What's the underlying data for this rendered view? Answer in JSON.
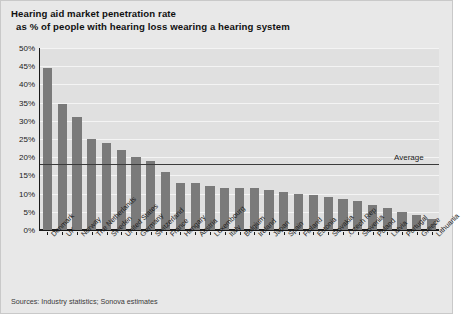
{
  "title": {
    "line1": "Hearing aid market penetration rate",
    "line2": "as % of people with hearing loss wearing a hearing system"
  },
  "footnote": "Sources: Industry statistics; Sonova estimates",
  "average": {
    "label": "Average",
    "value": 18
  },
  "colors": {
    "bar": "#7a7a7a",
    "panel_background": "#e0e0e0",
    "figure_background": "#e8e8e8",
    "gridline": "#f4f4f4",
    "axis": "#1a1a1a",
    "average_line": "#3b3b3b",
    "text": "#1a1a1a"
  },
  "chart_data": {
    "type": "bar",
    "title": "Hearing aid market penetration rate as % of people with hearing loss wearing a hearing system",
    "xlabel": "",
    "ylabel": "",
    "ylim": [
      0,
      50
    ],
    "ytick_labels": [
      "50%",
      "45%",
      "40%",
      "35%",
      "30%",
      "25%",
      "20%",
      "15%",
      "10%",
      "5%",
      "0%"
    ],
    "ytick_values": [
      50,
      45,
      40,
      35,
      30,
      25,
      20,
      15,
      10,
      5,
      0
    ],
    "grid": true,
    "legend": "none",
    "annotations": [
      {
        "text": "Average",
        "type": "hline",
        "value": 18
      }
    ],
    "categories": [
      "Denmark",
      "UK",
      "Norway",
      "The Netherlands",
      "Sweden",
      "United States",
      "Germany",
      "Switzerland",
      "France",
      "Hungary",
      "Austria",
      "Luxembourg",
      "Italy",
      "Belgium",
      "Ireland",
      "Japan",
      "Spain",
      "Finland",
      "Estonia",
      "Slovakia",
      "Czech Rep.",
      "Slovenia",
      "Poland",
      "Latvia",
      "Portugal",
      "Greece",
      "Lithuania"
    ],
    "values": [
      44.5,
      34.5,
      31.0,
      25.0,
      24.0,
      22.0,
      20.0,
      19.0,
      16.0,
      13.0,
      13.0,
      12.0,
      11.5,
      11.5,
      11.5,
      11.0,
      10.5,
      10.0,
      9.5,
      9.0,
      8.5,
      8.0,
      7.0,
      6.0,
      5.0,
      4.0,
      3.0
    ]
  }
}
